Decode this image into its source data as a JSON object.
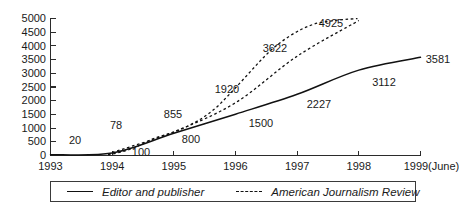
{
  "chart_data": {
    "type": "line",
    "title": "",
    "xlabel": "",
    "ylabel": "",
    "grid": false,
    "legend_position": "bottom",
    "ylim": [
      0,
      5000
    ],
    "yticks": [
      "0",
      "500",
      "1000",
      "1500",
      "2000",
      "2500",
      "3000",
      "3500",
      "4000",
      "4500",
      "5000"
    ],
    "categories": [
      "1993",
      "1994",
      "1995",
      "1996",
      "1997",
      "1998",
      "1999 (June)"
    ],
    "xtick_labels": [
      "1993",
      "1994",
      "1995",
      "1996",
      "1997",
      "1998",
      "1999",
      "(June)"
    ],
    "series": [
      {
        "name": "Editor and publisher",
        "style": "solid",
        "x": [
          "1993",
          "1994",
          "1995",
          "1996",
          "1997",
          "1998",
          "1999 (June)"
        ],
        "values": [
          20,
          78,
          800,
          1500,
          2227,
          3112,
          3581
        ],
        "labels": [
          "20",
          "78",
          "800",
          "1500",
          "2227",
          "3112",
          "3581"
        ]
      },
      {
        "name": "American Journalism Review",
        "style": "dashed",
        "x": [
          "1994",
          "1995",
          "1996",
          "1997",
          "1998"
        ],
        "values": [
          100,
          855,
          1920,
          3622,
          4925
        ],
        "labels": [
          "100",
          "855",
          "1920",
          "3622",
          "4925"
        ]
      }
    ],
    "point_labels": [
      {
        "text": "20",
        "x": 75,
        "y": 140
      },
      {
        "text": "78",
        "x": 116,
        "y": 125
      },
      {
        "text": "100",
        "x": 140,
        "y": 152
      },
      {
        "text": "855",
        "x": 172,
        "y": 114
      },
      {
        "text": "800",
        "x": 190,
        "y": 139
      },
      {
        "text": "1920",
        "x": 226,
        "y": 89
      },
      {
        "text": "1500",
        "x": 260,
        "y": 123
      },
      {
        "text": "3622",
        "x": 274,
        "y": 48
      },
      {
        "text": "2227",
        "x": 318,
        "y": 104
      },
      {
        "text": "4925",
        "x": 330,
        "y": 23
      },
      {
        "text": "3112",
        "x": 383,
        "y": 82
      },
      {
        "text": "3581",
        "x": 438,
        "y": 61
      }
    ]
  },
  "legend": {
    "entries": [
      {
        "label": "Editor and publisher",
        "style": "solid"
      },
      {
        "label": "American Journalism Review",
        "style": "dashed"
      }
    ]
  },
  "colors": {
    "ink": "#111111",
    "axis": "#2b2b2b",
    "background": "#ffffff"
  }
}
